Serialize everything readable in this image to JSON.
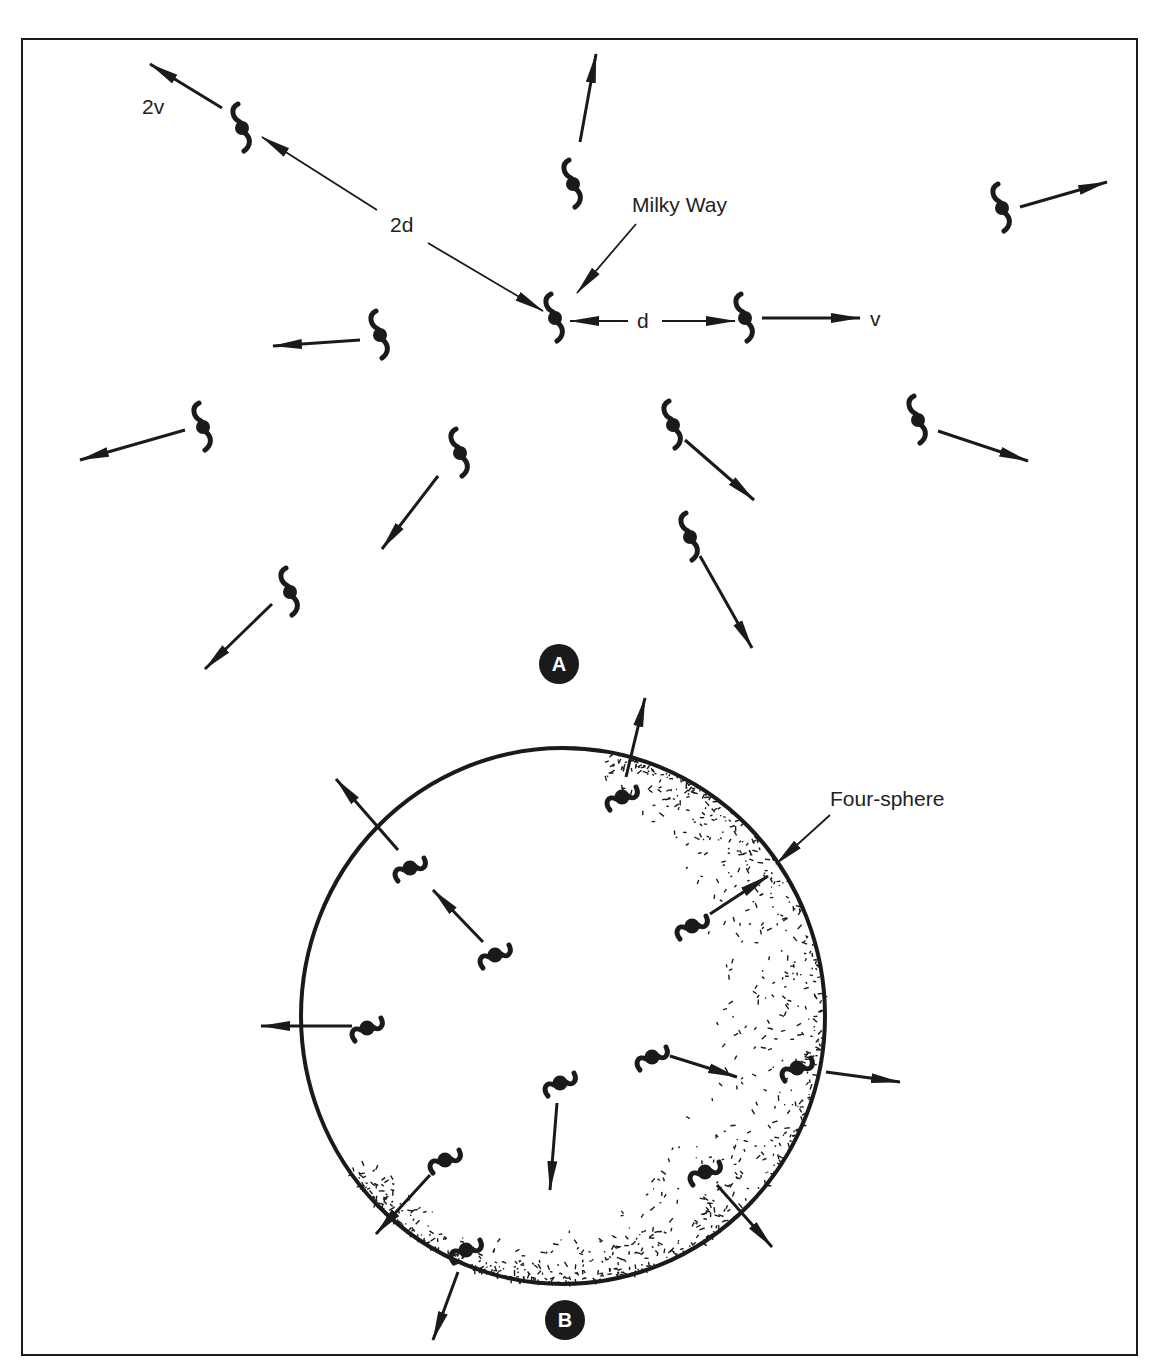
{
  "figure": {
    "panel_a": {
      "badge": "A",
      "labels": {
        "milky_way": "Milky Way",
        "distance_d": "d",
        "distance_2d": "2d",
        "velocity_v": "v",
        "velocity_2v": "2v"
      },
      "galaxies": [
        {
          "id": "milky-way",
          "x": 555,
          "y": 318
        },
        {
          "id": "g-2d",
          "x": 242,
          "y": 128
        },
        {
          "id": "g-d",
          "x": 745,
          "y": 318
        },
        {
          "id": "g-top",
          "x": 573,
          "y": 184
        },
        {
          "id": "g-right-top",
          "x": 1002,
          "y": 208
        },
        {
          "id": "g-left-mid",
          "x": 380,
          "y": 335
        },
        {
          "id": "g-left",
          "x": 203,
          "y": 427
        },
        {
          "id": "g-center-low",
          "x": 460,
          "y": 453
        },
        {
          "id": "g-bottom-left",
          "x": 290,
          "y": 592
        },
        {
          "id": "g-right-mid",
          "x": 673,
          "y": 425
        },
        {
          "id": "g-right",
          "x": 918,
          "y": 420
        },
        {
          "id": "g-lower-right",
          "x": 690,
          "y": 537
        }
      ]
    },
    "panel_b": {
      "badge": "B",
      "labels": {
        "four_sphere": "Four-sphere"
      },
      "sphere": {
        "cx": 563,
        "cy": 1016,
        "rx": 262,
        "ry": 268
      },
      "galaxies": [
        {
          "id": "b1",
          "x": 622,
          "y": 797
        },
        {
          "id": "b2",
          "x": 410,
          "y": 868
        },
        {
          "id": "b3",
          "x": 692,
          "y": 926
        },
        {
          "id": "b4",
          "x": 495,
          "y": 955
        },
        {
          "id": "b5",
          "x": 367,
          "y": 1028
        },
        {
          "id": "b6",
          "x": 652,
          "y": 1057
        },
        {
          "id": "b7",
          "x": 797,
          "y": 1068
        },
        {
          "id": "b8",
          "x": 560,
          "y": 1083
        },
        {
          "id": "b9",
          "x": 445,
          "y": 1160
        },
        {
          "id": "b10",
          "x": 705,
          "y": 1172
        },
        {
          "id": "b11",
          "x": 466,
          "y": 1250
        }
      ]
    },
    "colors": {
      "ink": "#1a1a1a",
      "background": "#ffffff"
    }
  }
}
